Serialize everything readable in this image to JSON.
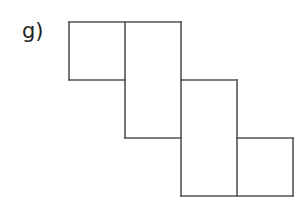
{
  "figure": {
    "label": "g)",
    "background_color": "#ffffff",
    "line_color": "#555555",
    "line_width": 1.6,
    "square_count": 6,
    "cell_size": 56,
    "grid": {
      "x_coords": [
        69,
        125,
        181,
        237,
        293
      ],
      "y_coords": [
        22,
        80,
        138,
        196
      ],
      "columns": 4,
      "rows": 3
    },
    "squares": [
      {
        "name": "square-r1c1",
        "row": 0,
        "col": 0,
        "x": 69,
        "y": 22,
        "size": 56
      },
      {
        "name": "square-r1c2",
        "row": 0,
        "col": 1,
        "x": 125,
        "y": 22,
        "size": 56
      },
      {
        "name": "square-r2c2",
        "row": 1,
        "col": 1,
        "x": 125,
        "y": 80,
        "size": 56
      },
      {
        "name": "square-r2c3",
        "row": 1,
        "col": 2,
        "x": 181,
        "y": 80,
        "size": 56
      },
      {
        "name": "square-r3c3",
        "row": 2,
        "col": 2,
        "x": 181,
        "y": 138,
        "size": 56
      },
      {
        "name": "square-r3c4",
        "row": 2,
        "col": 3,
        "x": 237,
        "y": 138,
        "size": 56
      }
    ],
    "segments": [
      {
        "name": "row1-top-edge",
        "x1": 69,
        "y1": 22,
        "x2": 181,
        "y2": 22
      },
      {
        "name": "row1-left-edge",
        "x1": 69,
        "y1": 22,
        "x2": 69,
        "y2": 80
      },
      {
        "name": "row1-bottom-edge",
        "x1": 69,
        "y1": 80,
        "x2": 125,
        "y2": 80
      },
      {
        "name": "row1-inner-vertical",
        "x1": 125,
        "y1": 22,
        "x2": 125,
        "y2": 80
      },
      {
        "name": "row1-right-edge",
        "x1": 181,
        "y1": 22,
        "x2": 181,
        "y2": 80
      },
      {
        "name": "row2-top-edge",
        "x1": 181,
        "y1": 80,
        "x2": 237,
        "y2": 80
      },
      {
        "name": "row2-left-edge",
        "x1": 125,
        "y1": 80,
        "x2": 125,
        "y2": 138
      },
      {
        "name": "row2-inner-vertical",
        "x1": 181,
        "y1": 80,
        "x2": 181,
        "y2": 138
      },
      {
        "name": "row2-right-edge",
        "x1": 237,
        "y1": 80,
        "x2": 237,
        "y2": 138
      },
      {
        "name": "row2-bottom-edge",
        "x1": 125,
        "y1": 138,
        "x2": 181,
        "y2": 138
      },
      {
        "name": "row3-top-edge",
        "x1": 237,
        "y1": 138,
        "x2": 293,
        "y2": 138
      },
      {
        "name": "row3-left-edge",
        "x1": 181,
        "y1": 138,
        "x2": 181,
        "y2": 196
      },
      {
        "name": "row3-inner-vertical",
        "x1": 237,
        "y1": 138,
        "x2": 237,
        "y2": 196
      },
      {
        "name": "row3-right-edge",
        "x1": 293,
        "y1": 138,
        "x2": 293,
        "y2": 196
      },
      {
        "name": "row3-bottom-edge",
        "x1": 181,
        "y1": 196,
        "x2": 293,
        "y2": 196
      }
    ]
  }
}
